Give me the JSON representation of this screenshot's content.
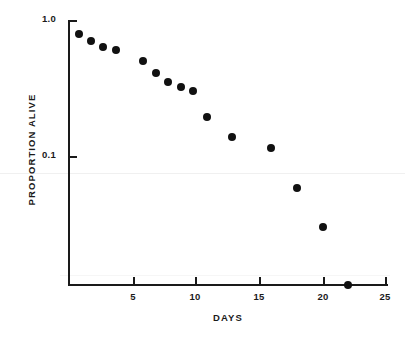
{
  "chart_data": {
    "type": "scatter",
    "title": "",
    "subtitle": "",
    "xlabel": "DAYS",
    "ylabel": "PROPORTION ALIVE",
    "yscale": "log",
    "xscale": "linear",
    "xlim": [
      0,
      25.5
    ],
    "ylim": [
      0.006,
      1.0
    ],
    "grid": false,
    "legend": null,
    "x_ticks": [
      5,
      10,
      15,
      20,
      25
    ],
    "x_tick_labels": [
      "5",
      "10",
      "15",
      "20",
      "25"
    ],
    "y_ticks": [
      1.0,
      0.1
    ],
    "y_tick_labels": [
      "1.0",
      "0.1"
    ],
    "series": [
      {
        "name": "survival",
        "marker": "filled-circle",
        "color": "#111111",
        "x": [
          1,
          2,
          3,
          4,
          6,
          7,
          8,
          9,
          10,
          11,
          13,
          16,
          18,
          20,
          22
        ],
        "y": [
          0.78,
          0.71,
          0.65,
          0.63,
          0.5,
          0.41,
          0.36,
          0.33,
          0.31,
          0.2,
          0.14,
          0.12,
          0.058,
          0.03,
          0.007
        ]
      }
    ],
    "points_px": [
      {
        "x": 79,
        "y": 34
      },
      {
        "x": 91,
        "y": 41
      },
      {
        "x": 103,
        "y": 47
      },
      {
        "x": 116,
        "y": 50
      },
      {
        "x": 143,
        "y": 61
      },
      {
        "x": 156,
        "y": 73
      },
      {
        "x": 168,
        "y": 82
      },
      {
        "x": 181,
        "y": 87
      },
      {
        "x": 193,
        "y": 91
      },
      {
        "x": 207,
        "y": 117
      },
      {
        "x": 232,
        "y": 137
      },
      {
        "x": 271,
        "y": 148
      },
      {
        "x": 297,
        "y": 188
      },
      {
        "x": 323,
        "y": 227
      },
      {
        "x": 348,
        "y": 285
      }
    ],
    "x_tick_px": [
      133,
      195,
      259,
      323,
      385
    ],
    "y_tick_px": [
      20,
      156
    ]
  },
  "colors": {
    "background": "#ffffff",
    "axis": "#1a1a1a",
    "marker": "#111111",
    "text": "#1a1a1a"
  }
}
